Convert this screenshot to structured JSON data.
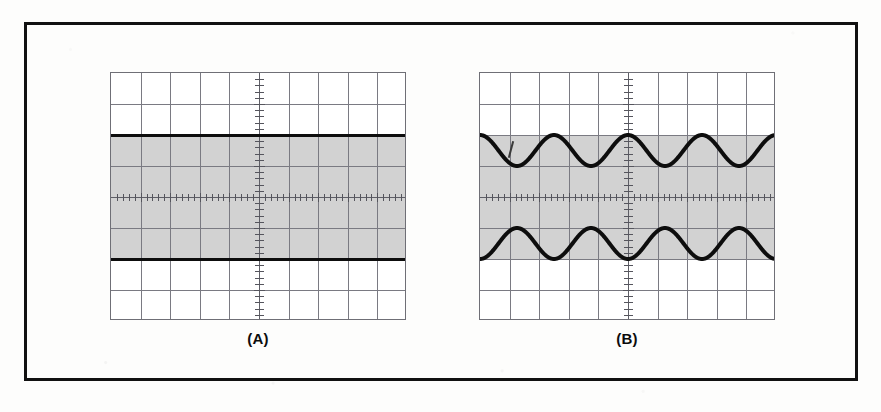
{
  "figure": {
    "background_color": "#fdfdfc",
    "border_color": "#111111",
    "panels": [
      {
        "id": "panel-a",
        "caption": "(A)",
        "x": 110,
        "y": 72,
        "width": 296,
        "height": 248,
        "graticule": {
          "columns": 10,
          "rows": 8,
          "line_color": "#7a7a82",
          "border_color": "#6f6f76",
          "minor_ticks_per_division": 5
        },
        "shading": {
          "color": "#d2d2d2",
          "top_division": 2,
          "bottom_division": -2
        },
        "traces": [
          {
            "name": "upper-envelope",
            "type": "flat",
            "level_divisions": 2,
            "color": "#0d0d0d",
            "thickness": 3
          },
          {
            "name": "lower-envelope",
            "type": "flat",
            "level_divisions": -2,
            "color": "#0d0d0d",
            "thickness": 3
          }
        ]
      },
      {
        "id": "panel-b",
        "caption": "(B)",
        "x": 479,
        "y": 72,
        "width": 296,
        "height": 248,
        "graticule": {
          "columns": 10,
          "rows": 8,
          "line_color": "#7a7a82",
          "border_color": "#6f6f76",
          "minor_ticks_per_division": 5
        },
        "shading": {
          "color": "#d2d2d2",
          "top_division": 2,
          "bottom_division": -2
        },
        "traces": [
          {
            "name": "upper-envelope",
            "type": "sine",
            "cycles": 4,
            "max_divisions": 2,
            "min_divisions": 1,
            "phase": "peak-at-center",
            "color": "#0d0d0d",
            "thickness": 4
          },
          {
            "name": "lower-envelope",
            "type": "sine",
            "cycles": 4,
            "max_divisions": -1,
            "min_divisions": -2,
            "phase": "trough-at-center",
            "color": "#0d0d0d",
            "thickness": 4
          }
        ],
        "annotation": {
          "name": "stray-pen-mark",
          "x_offset": 30,
          "y_offset": 68
        }
      }
    ]
  },
  "chart_data": {
    "type": "line",
    "title": "",
    "xlabel": "",
    "ylabel": "",
    "xlim": [
      -5,
      5
    ],
    "ylim": [
      -4,
      4
    ],
    "grid": true,
    "legend_position": "none",
    "axis_units": "divisions",
    "subplots": [
      {
        "label": "(A)",
        "description": "Unmodulated carrier envelope: two flat horizontal traces at +2 and -2 divisions with shaded region between.",
        "series": [
          {
            "name": "upper envelope",
            "x": [
              -5,
              5
            ],
            "values": [
              2,
              2
            ]
          },
          {
            "name": "lower envelope",
            "x": [
              -5,
              5
            ],
            "values": [
              -2,
              -2
            ]
          }
        ]
      },
      {
        "label": "(B)",
        "description": "Amplitude-modulated envelope: two mirrored sinusoids, upper oscillating between +1 and +2 divisions, lower between -1 and -2 divisions, four cycles across the 10-division screen.",
        "series": [
          {
            "name": "upper envelope",
            "x": [
              -5,
              -4.375,
              -3.75,
              -3.125,
              -2.5,
              -1.875,
              -1.25,
              -0.625,
              0,
              0.625,
              1.25,
              1.875,
              2.5,
              3.125,
              3.75,
              4.375,
              5
            ],
            "values": [
              2,
              1.5,
              1,
              1.5,
              2,
              1.5,
              1,
              1.5,
              2,
              1.5,
              1,
              1.5,
              2,
              1.5,
              1,
              1.5,
              2
            ]
          },
          {
            "name": "lower envelope",
            "x": [
              -5,
              -4.375,
              -3.75,
              -3.125,
              -2.5,
              -1.875,
              -1.25,
              -0.625,
              0,
              0.625,
              1.25,
              1.875,
              2.5,
              3.125,
              3.75,
              4.375,
              5
            ],
            "values": [
              -2,
              -1.5,
              -1,
              -1.5,
              -2,
              -1.5,
              -1,
              -1.5,
              -2,
              -1.5,
              -1,
              -1.5,
              -2,
              -1.5,
              -1,
              -1.5,
              -2
            ]
          }
        ]
      }
    ]
  }
}
